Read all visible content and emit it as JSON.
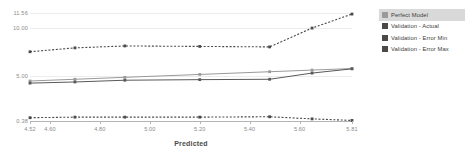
{
  "chart_data": {
    "type": "line",
    "title": "",
    "xlabel": "Predicted",
    "ylabel": "",
    "xlim": [
      4.52,
      5.81
    ],
    "ylim": [
      0.38,
      11.56
    ],
    "grid": true,
    "legend_position": "right",
    "x_ticks": [
      "4.52",
      "4.60",
      "4.80",
      "5.00",
      "5.20",
      "5.40",
      "5.60",
      "5.81"
    ],
    "x_tick_values": [
      4.52,
      4.6,
      4.8,
      5.0,
      5.2,
      5.4,
      5.6,
      5.81
    ],
    "y_ticks": [
      "11.56",
      "10.00",
      "5.00",
      "0.38"
    ],
    "y_tick_values": [
      11.56,
      10.0,
      5.0,
      0.38
    ],
    "x": [
      4.52,
      4.7,
      4.9,
      5.2,
      5.48,
      5.65,
      5.81
    ],
    "series": [
      {
        "name": "Perfect Model",
        "style": "solid",
        "color": "#9a9a9a",
        "values": [
          4.52,
          4.7,
          4.9,
          5.2,
          5.48,
          5.65,
          5.81
        ]
      },
      {
        "name": "Validation - Actual",
        "style": "solid",
        "color": "#595959",
        "values": [
          4.3,
          4.42,
          4.6,
          4.66,
          4.7,
          5.34,
          5.78
        ]
      },
      {
        "name": "Validation - Error Min",
        "style": "dashed",
        "color": "#4a4a4a",
        "values": [
          0.72,
          0.78,
          0.78,
          0.78,
          0.82,
          0.6,
          0.44
        ]
      },
      {
        "name": "Validation - Error Max",
        "style": "dashed",
        "color": "#4a4a4a",
        "values": [
          7.55,
          7.95,
          8.15,
          8.1,
          8.05,
          10.0,
          11.45
        ]
      }
    ]
  },
  "legend": {
    "items": [
      {
        "label": "Perfect Model",
        "color": "#9a9a9a",
        "selected": true
      },
      {
        "label": "Validation - Actual",
        "color": "#4a4a4a",
        "selected": false
      },
      {
        "label": "Validation - Error Min",
        "color": "#4a4a4a",
        "selected": false
      },
      {
        "label": "Validation - Error Max",
        "color": "#4a4a4a",
        "selected": false
      }
    ]
  },
  "axis": {
    "x_title": "Predicted"
  }
}
